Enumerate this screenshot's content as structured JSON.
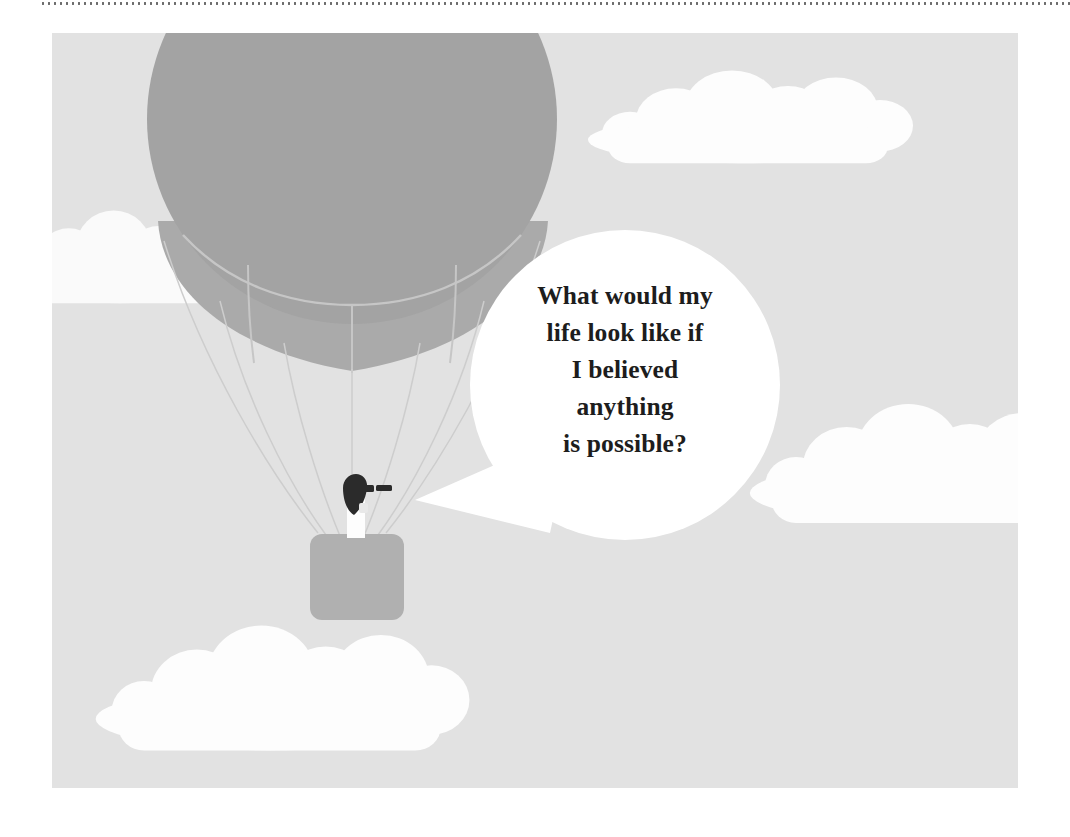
{
  "page": {
    "width": 1070,
    "height": 837,
    "background": "#ffffff",
    "top_rule": {
      "style": "dotted",
      "color": "#6b6b6b"
    }
  },
  "illustration": {
    "title": "hot-air-balloon-with-speech-bubble",
    "frame": {
      "x": 52,
      "y": 33,
      "width": 966,
      "height": 755
    },
    "colors": {
      "sky": "#e2e2e2",
      "cloud": "#ffffff",
      "balloon": "#a3a3a3",
      "balloon_skirt": "#aaaaaa",
      "balloon_seam": "#c4c4c4",
      "basket": "#b0b0b0",
      "rope": "#cfcfcf",
      "bubble": "#ffffff",
      "person_dark": "#2b2b2b",
      "person_light": "#ffffff",
      "text": "#1d1d1d"
    },
    "elements": [
      {
        "name": "balloon-envelope",
        "label": "Hot air balloon envelope"
      },
      {
        "name": "balloon-skirt",
        "label": "Balloon lower skirt"
      },
      {
        "name": "balloon-ropes",
        "label": "Suspension ropes"
      },
      {
        "name": "balloon-basket",
        "label": "Balloon basket"
      },
      {
        "name": "balloon-passenger",
        "label": "Passenger with binoculars"
      },
      {
        "name": "cloud-top-right",
        "label": "Cloud top right"
      },
      {
        "name": "cloud-left",
        "label": "Cloud left"
      },
      {
        "name": "cloud-right",
        "label": "Cloud right"
      },
      {
        "name": "cloud-bottom-left",
        "label": "Cloud bottom left"
      }
    ]
  },
  "speech_bubble": {
    "shape": "circle",
    "center": {
      "x": 625,
      "y": 385
    },
    "radius": 155,
    "tail_tip": {
      "x": 415,
      "y": 500
    },
    "lines": [
      "What would my",
      "life look like if",
      "I believed",
      "anything",
      "is possible?"
    ],
    "full_text": "What would my life look like if I believed anything is possible?"
  }
}
